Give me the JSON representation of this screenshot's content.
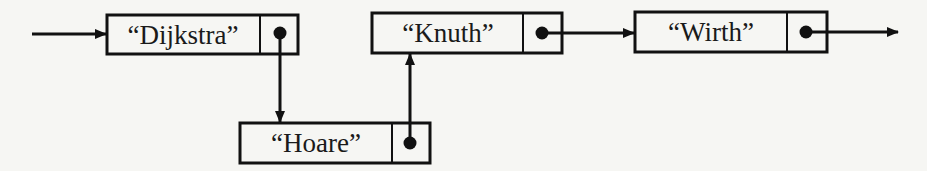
{
  "diagram": {
    "type": "linked-list",
    "colors": {
      "background": "#f6f6f3",
      "stroke": "#111111"
    },
    "nodes": [
      {
        "id": "n1",
        "label": "“Dijkstra”",
        "x": 107,
        "y": 15,
        "w": 191,
        "h": 39,
        "divider": 260
      },
      {
        "id": "n2",
        "label": "“Hoare”",
        "x": 240,
        "y": 123,
        "w": 190,
        "h": 40,
        "divider": 392
      },
      {
        "id": "n3",
        "label": "“Knuth”",
        "x": 372,
        "y": 13,
        "w": 190,
        "h": 40,
        "divider": 523
      },
      {
        "id": "n4",
        "label": "“Wirth”",
        "x": 635,
        "y": 12,
        "w": 192,
        "h": 40,
        "divider": 787
      }
    ],
    "edges": [
      {
        "from": "head",
        "to": "n1",
        "direction": "right"
      },
      {
        "from": "n1",
        "to": "n2",
        "direction": "down"
      },
      {
        "from": "n2",
        "to": "n3",
        "direction": "up"
      },
      {
        "from": "n3",
        "to": "n4",
        "direction": "right"
      },
      {
        "from": "n4",
        "to": "next",
        "direction": "right"
      }
    ]
  }
}
